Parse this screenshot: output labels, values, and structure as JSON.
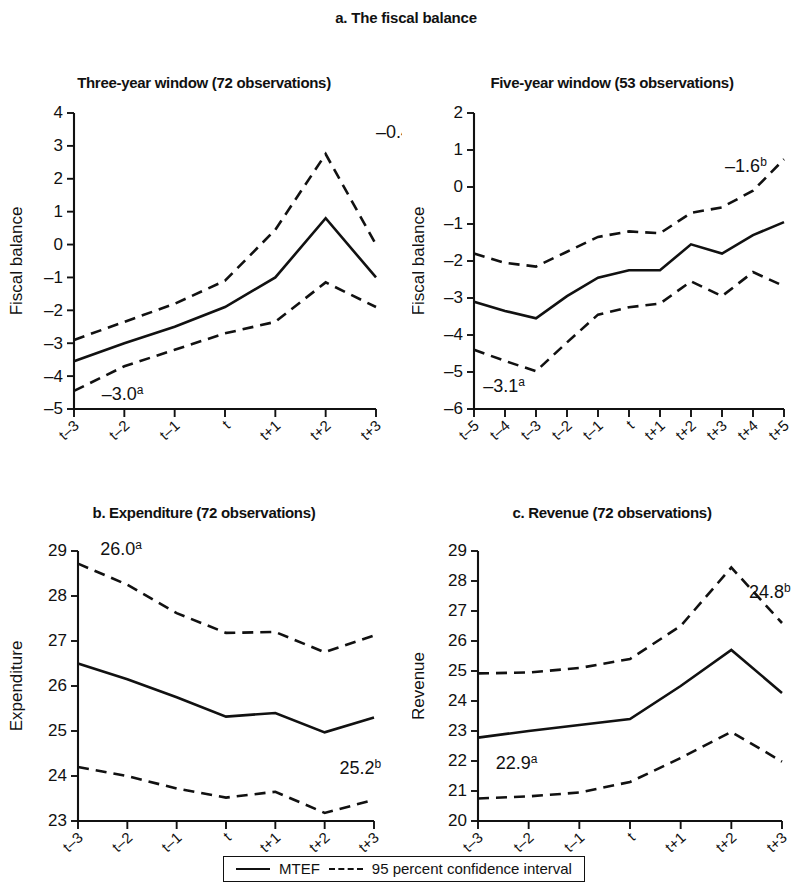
{
  "figure": {
    "title": "a. The fiscal balance",
    "legend": {
      "mtef_label": "MTEF",
      "ci_label": "95 percent confidence interval"
    }
  },
  "chart_data": [
    {
      "type": "line",
      "panel_id": "a-three-year",
      "title": "Three-year window (72 observations)",
      "xlabel": "",
      "ylabel": "Fiscal balance",
      "categories": [
        "t–3",
        "t–2",
        "t–1",
        "t",
        "t+1",
        "t+2",
        "t+3"
      ],
      "ylim": [
        -5,
        4
      ],
      "yticks": [
        4,
        3,
        2,
        1,
        0,
        -1,
        -2,
        -3,
        -4,
        -5
      ],
      "grid": false,
      "legend_position": "bottom",
      "series": [
        {
          "name": "MTEF",
          "style": "solid",
          "values": [
            -3.55,
            -3.0,
            -2.5,
            -1.9,
            -1.0,
            0.8,
            -1.0
          ]
        },
        {
          "name": "95 percent confidence interval upper",
          "style": "dashed",
          "values": [
            -2.9,
            -2.35,
            -1.8,
            -1.1,
            0.45,
            2.75,
            0.0
          ]
        },
        {
          "name": "95 percent confidence interval lower",
          "style": "dashed",
          "values": [
            -4.45,
            -3.7,
            -3.2,
            -2.7,
            -2.35,
            -1.15,
            -1.9
          ]
        }
      ],
      "annotations": [
        {
          "text": "–0.4",
          "sup": "b",
          "x": 6,
          "y": 3.25
        },
        {
          "text": "–3.0",
          "sup": "a",
          "x": 0.55,
          "y": -4.72
        }
      ]
    },
    {
      "type": "line",
      "panel_id": "a-five-year",
      "title": "Five-year window (53 observations)",
      "xlabel": "",
      "ylabel": "Fiscal balance",
      "categories": [
        "t–5",
        "t–4",
        "t–3",
        "t–2",
        "t–1",
        "t",
        "t+1",
        "t+2",
        "t+3",
        "t+4",
        "t+5"
      ],
      "ylim": [
        -6,
        2
      ],
      "yticks": [
        2,
        1,
        0,
        -1,
        -2,
        -3,
        -4,
        -5,
        -6
      ],
      "grid": false,
      "legend_position": "bottom",
      "series": [
        {
          "name": "MTEF",
          "style": "solid",
          "values": [
            -3.1,
            -3.35,
            -3.55,
            -2.95,
            -2.45,
            -2.25,
            -2.25,
            -1.55,
            -1.8,
            -1.3,
            -0.95
          ]
        },
        {
          "name": "95 percent confidence interval upper",
          "style": "dashed",
          "values": [
            -1.8,
            -2.05,
            -2.15,
            -1.75,
            -1.35,
            -1.2,
            -1.25,
            -0.7,
            -0.55,
            -0.1,
            0.75
          ]
        },
        {
          "name": "95 percent confidence interval lower",
          "style": "dashed",
          "values": [
            -4.4,
            -4.7,
            -4.98,
            -4.2,
            -3.45,
            -3.25,
            -3.15,
            -2.55,
            -2.95,
            -2.3,
            -2.68
          ]
        }
      ],
      "annotations": [
        {
          "text": "–1.6",
          "sup": "b",
          "x": 8.1,
          "y": 0.4
        },
        {
          "text": "–3.1",
          "sup": "a",
          "x": 0.3,
          "y": -5.55
        }
      ]
    },
    {
      "type": "line",
      "panel_id": "b-expenditure",
      "title": "b. Expenditure (72 observations)",
      "xlabel": "",
      "ylabel": "Expenditure",
      "categories": [
        "t–3",
        "t–2",
        "t–1",
        "t",
        "t+1",
        "t+2",
        "t+3"
      ],
      "ylim": [
        23,
        29
      ],
      "yticks": [
        29,
        28,
        27,
        26,
        25,
        24,
        23
      ],
      "grid": false,
      "legend_position": "bottom",
      "series": [
        {
          "name": "MTEF",
          "style": "solid",
          "values": [
            26.5,
            26.15,
            25.75,
            25.32,
            25.4,
            24.97,
            25.3
          ]
        },
        {
          "name": "95 percent confidence interval upper",
          "style": "dashed",
          "values": [
            28.72,
            28.25,
            27.62,
            27.18,
            27.2,
            26.75,
            27.12
          ]
        },
        {
          "name": "95 percent confidence interval lower",
          "style": "dashed",
          "values": [
            24.2,
            24.0,
            23.72,
            23.52,
            23.65,
            23.18,
            23.47
          ]
        }
      ],
      "annotations": [
        {
          "text": "26.0",
          "sup": "a",
          "x": 0.45,
          "y": 28.92
        },
        {
          "text": "25.2",
          "sup": "b",
          "x": 5.3,
          "y": 24.05
        }
      ]
    },
    {
      "type": "line",
      "panel_id": "c-revenue",
      "title": "c. Revenue (72 observations)",
      "xlabel": "",
      "ylabel": "Revenue",
      "categories": [
        "t–3",
        "t–2",
        "t–1",
        "t",
        "t+1",
        "t+2",
        "t+3"
      ],
      "ylim": [
        20,
        29
      ],
      "yticks": [
        29,
        28,
        27,
        26,
        25,
        24,
        23,
        22,
        21,
        20
      ],
      "grid": false,
      "legend_position": "bottom",
      "series": [
        {
          "name": "MTEF",
          "style": "solid",
          "values": [
            22.78,
            23.0,
            23.2,
            23.4,
            24.5,
            25.7,
            24.27
          ]
        },
        {
          "name": "95 percent confidence interval upper",
          "style": "dashed",
          "values": [
            24.92,
            24.95,
            25.1,
            25.4,
            26.5,
            28.45,
            26.6
          ]
        },
        {
          "name": "95 percent confidence interval lower",
          "style": "dashed",
          "values": [
            20.75,
            20.82,
            20.95,
            21.3,
            22.1,
            22.97,
            21.98
          ]
        }
      ],
      "annotations": [
        {
          "text": "22.9",
          "sup": "a",
          "x": 0.35,
          "y": 21.72
        },
        {
          "text": "24.8",
          "sup": "b",
          "x": 5.35,
          "y": 27.45
        }
      ]
    }
  ]
}
